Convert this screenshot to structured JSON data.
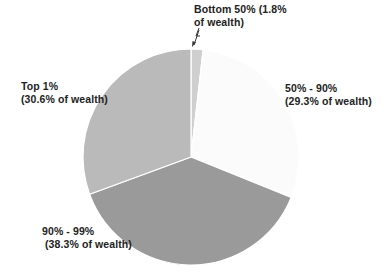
{
  "chart_data": {
    "type": "pie",
    "title": "",
    "start_angle_deg": 0,
    "direction": "clockwise",
    "slices": [
      {
        "name": "Bottom 50%",
        "value": 1.8,
        "label_line1": "Bottom 50% (1.8%",
        "label_line2": "of wealth)",
        "color": "#cfcfcf"
      },
      {
        "name": "50% - 90%",
        "value": 29.3,
        "label_line1": "50% - 90%",
        "label_line2": "(29.3% of wealth)",
        "color": "#fbfbfb"
      },
      {
        "name": "90% - 99%",
        "value": 38.3,
        "label_line1": "90% - 99%",
        "label_line2": "(38.3% of wealth)",
        "color": "#9a9a9a"
      },
      {
        "name": "Top 1%",
        "value": 30.6,
        "label_line1": "Top 1%",
        "label_line2": "(30.6% of wealth)",
        "color": "#bababa"
      }
    ],
    "categories": [
      "Bottom 50%",
      "50% - 90%",
      "90% - 99%",
      "Top 1%"
    ],
    "values": [
      1.8,
      29.3,
      38.3,
      30.6
    ],
    "units": "% of wealth",
    "legend": "none (data labels)"
  }
}
